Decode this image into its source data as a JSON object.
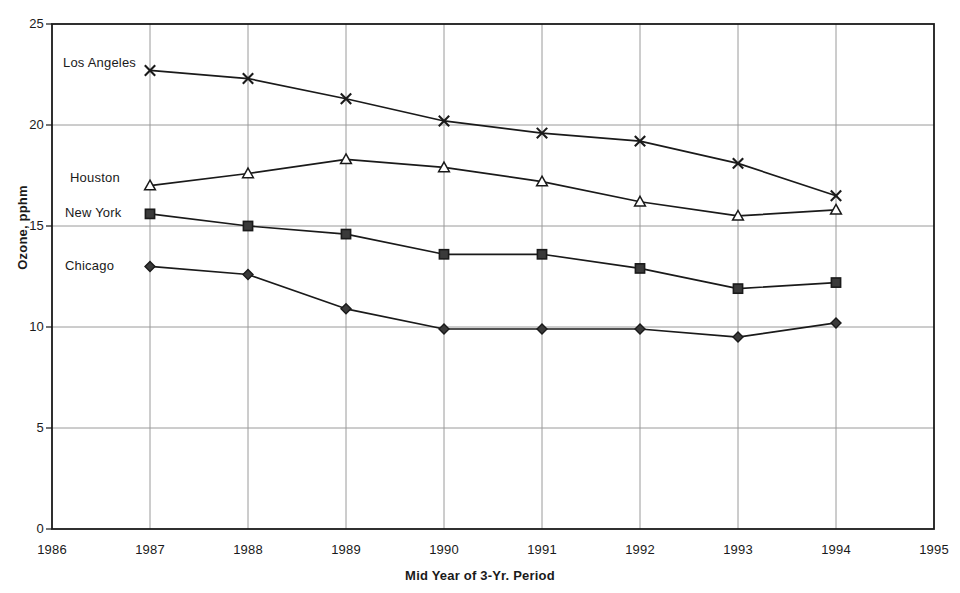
{
  "chart_data": {
    "type": "line",
    "title": "",
    "xlabel": "Mid Year of 3-Yr. Period",
    "ylabel": "Ozone, pphm",
    "x": [
      1987,
      1988,
      1989,
      1990,
      1991,
      1992,
      1993,
      1994
    ],
    "xlim": [
      1986,
      1995
    ],
    "ylim": [
      0,
      25
    ],
    "xticks": [
      1986,
      1987,
      1988,
      1989,
      1990,
      1991,
      1992,
      1993,
      1994,
      1995
    ],
    "yticks": [
      0,
      5,
      10,
      15,
      20,
      25
    ],
    "grid": true,
    "legend_position": "inline-left-labels",
    "series": [
      {
        "name": "Los Angeles",
        "marker": "x-cross",
        "values": [
          22.7,
          22.3,
          21.3,
          20.2,
          19.6,
          19.2,
          18.1,
          16.5
        ]
      },
      {
        "name": "Houston",
        "marker": "open-triangle",
        "values": [
          17.0,
          17.6,
          18.3,
          17.9,
          17.2,
          16.2,
          15.5,
          15.8
        ]
      },
      {
        "name": "New York",
        "marker": "filled-square",
        "values": [
          15.6,
          15.0,
          14.6,
          13.6,
          13.6,
          12.9,
          11.9,
          12.2
        ]
      },
      {
        "name": "Chicago",
        "marker": "filled-diamond",
        "values": [
          13.0,
          12.6,
          10.9,
          9.9,
          9.9,
          9.9,
          9.5,
          10.2
        ]
      }
    ],
    "series_label_positions": [
      {
        "name": "Los Angeles",
        "x": 63,
        "y": 56
      },
      {
        "name": "Houston",
        "x": 70,
        "y": 171
      },
      {
        "name": "New York",
        "x": 65,
        "y": 206
      },
      {
        "name": "Chicago",
        "x": 65,
        "y": 259
      }
    ],
    "colors": {
      "line": "#1a1a1a",
      "grid": "#9a9a9a",
      "axis": "#1a1a1a",
      "background": "#ffffff",
      "marker_fill": "#3a3a3a"
    }
  }
}
